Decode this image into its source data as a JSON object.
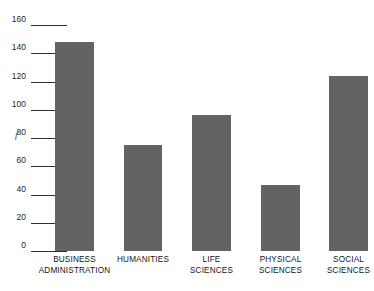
{
  "chart_data": {
    "type": "bar",
    "title": "",
    "xlabel": "",
    "ylabel": "f",
    "categories": [
      "BUSINESS\nADMINISTRATION",
      "HUMANITIES",
      "LIFE\nSCIENCES",
      "PHYSICAL\nSCIENCES",
      "SOCIAL\nSCIENCES"
    ],
    "values": [
      148,
      75,
      96,
      47,
      124
    ],
    "ylim": [
      0,
      160
    ],
    "yticks": [
      0,
      20,
      40,
      60,
      80,
      100,
      120,
      140,
      160
    ],
    "ytick_labels": [
      "0",
      "20",
      "40",
      "60",
      "80",
      "100",
      "120",
      "140",
      "160"
    ],
    "grid": false,
    "legend": null,
    "bar_color": "#636363",
    "axis_color": "#2e2e2e",
    "background": "#ffffff"
  },
  "axis": {
    "y_label": "f",
    "ticks": [
      {
        "value": 160,
        "label": "160",
        "line_width": 36
      },
      {
        "value": 140,
        "label": "140",
        "line_width": 36
      },
      {
        "value": 120,
        "label": "120",
        "line_width": 36
      },
      {
        "value": 100,
        "label": "100",
        "line_width": 36
      },
      {
        "value": 80,
        "label": "80",
        "line_width": 36
      },
      {
        "value": 60,
        "label": "60",
        "line_width": 36
      },
      {
        "value": 40,
        "label": "40",
        "line_width": 36
      },
      {
        "value": 20,
        "label": "20",
        "line_width": 36
      },
      {
        "value": 0,
        "label": "0",
        "line_width": 36
      }
    ]
  },
  "bars": [
    {
      "label": "BUSINESS\nADMINISTRATION",
      "value": 148,
      "x": 24,
      "width": 39
    },
    {
      "label": "HUMANITIES",
      "value": 75,
      "x": 93,
      "width": 38
    },
    {
      "label": "LIFE\nSCIENCES",
      "value": 96,
      "x": 161,
      "width": 39
    },
    {
      "label": "PHYSICAL\nSCIENCES",
      "value": 47,
      "x": 230,
      "width": 39
    },
    {
      "label": "SOCIAL\nSCIENCES",
      "value": 124,
      "x": 298,
      "width": 39
    }
  ]
}
